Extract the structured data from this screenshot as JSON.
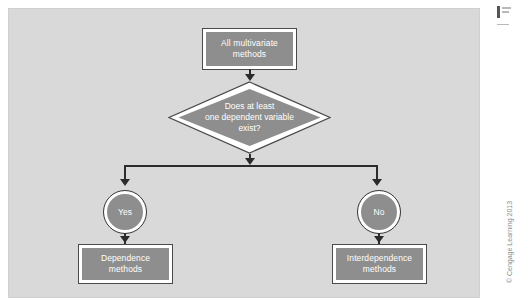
{
  "figure": {
    "type": "flowchart",
    "panel_color": "#d9d9d9",
    "node_fill_color": "#8e8e8e",
    "node_border_color": "#ffffff",
    "node_outline_color": "#4a4a4a",
    "connector_color": "#2b2b2b",
    "text_color": "#ffffff"
  },
  "nodes": {
    "top_box": {
      "shape": "rectangle",
      "lines": [
        "All multivariate",
        "methods"
      ]
    },
    "decision": {
      "shape": "diamond",
      "lines": [
        "Does at least",
        "one dependent variable",
        "exist?"
      ]
    },
    "yes_circle": {
      "shape": "circle",
      "label": "Yes"
    },
    "no_circle": {
      "shape": "circle",
      "label": "No"
    },
    "dependence_box": {
      "shape": "rectangle",
      "lines": [
        "Dependence",
        "methods"
      ]
    },
    "interdependence_box": {
      "shape": "rectangle",
      "lines": [
        "Interdependence",
        "methods"
      ]
    }
  },
  "edges": [
    {
      "from": "top_box",
      "to": "decision",
      "label": ""
    },
    {
      "from": "decision",
      "to": "yes_circle",
      "label": ""
    },
    {
      "from": "decision",
      "to": "no_circle",
      "label": ""
    },
    {
      "from": "yes_circle",
      "to": "dependence_box",
      "label": ""
    },
    {
      "from": "no_circle",
      "to": "interdependence_box",
      "label": ""
    }
  ],
  "credit": {
    "text": "© Cengage Learning 2013"
  }
}
